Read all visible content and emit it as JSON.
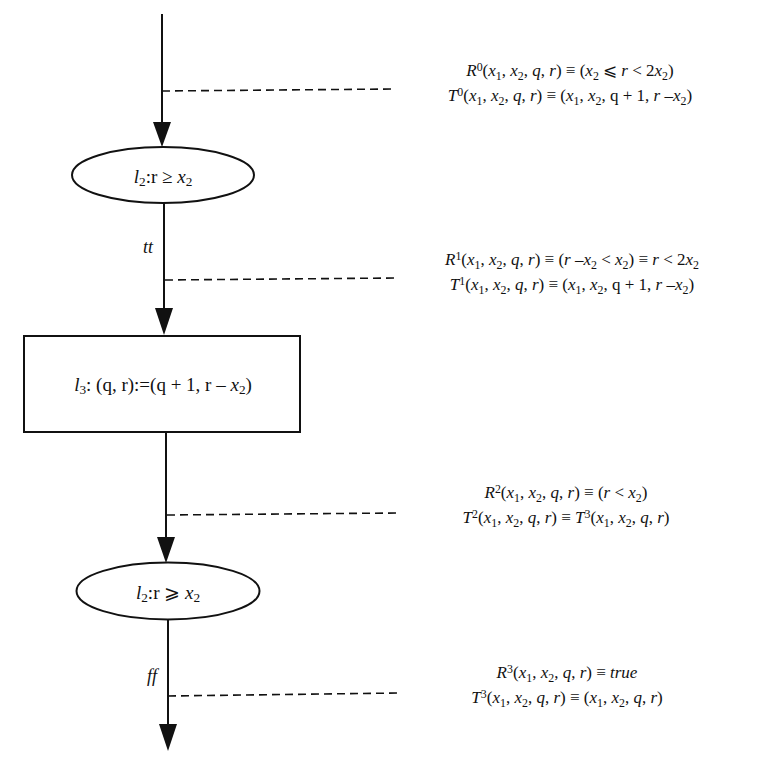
{
  "diagram": {
    "type": "flowchart",
    "colors": {
      "stroke": "#111111",
      "background": "#ffffff"
    },
    "nodes": [
      {
        "id": "n1",
        "shape": "ellipse",
        "label_prefix": "l",
        "label_sub": "2",
        "label_rest": ":r ≥ ",
        "label_var": "x",
        "label_var_sub": "2",
        "full_label": "l2:r ≥ x2"
      },
      {
        "id": "n2",
        "shape": "rectangle",
        "label_prefix": "l",
        "label_sub": "3",
        "label_rest": ": (q, r):=(q + 1, r – ",
        "label_var": "x",
        "label_var_sub": "2",
        "label_end": ")",
        "full_label": "l3: (q, r):=(q + 1, r – x2)"
      },
      {
        "id": "n3",
        "shape": "ellipse",
        "label_prefix": "l",
        "label_sub": "2",
        "label_rest": ":r ⩾ ",
        "label_var": "x",
        "label_var_sub": "2",
        "full_label": "l2:r ⩾ x2"
      }
    ],
    "edge_labels": [
      {
        "id": "e_tt",
        "text": "tt"
      },
      {
        "id": "e_ff",
        "text": "ff"
      }
    ],
    "annotations": [
      {
        "id": "a0",
        "R": "R0(x1, x2, q, r) ≡ (x2 ⩽ r < 2x2)",
        "T": "T0(x1, x2, q, r) ≡ (x1, x2, q + 1, r –x2)"
      },
      {
        "id": "a1",
        "R": "R1(x1, x2, q, r) ≡ (r –x2 < x2) ≡ r < 2x2",
        "T": "T1(x1, x2, q, r) ≡ (x1, x2, q + 1, r –x2)"
      },
      {
        "id": "a2",
        "R": "R2(x1, x2, q, r) ≡ (r < x2)",
        "T": "T2(x1, x2, q, r) ≡ T3(x1, x2, q, r)"
      },
      {
        "id": "a3",
        "R": "R3(x1, x2, q, r) ≡ true",
        "T": "T3(x1, x2, q, r) ≡ (x1, x2, q, r)"
      }
    ]
  }
}
